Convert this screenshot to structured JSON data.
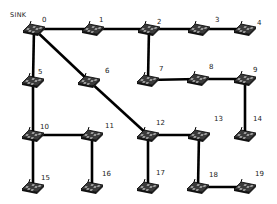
{
  "diagram": {
    "type": "wireless-sensor-network-topology",
    "sink_label": "SINK",
    "sink_node": "0",
    "line_color": "#000000",
    "node_icon": "sensor-mote-icon",
    "nodes": [
      {
        "id": "0",
        "label": "0",
        "x": 34,
        "y": 29,
        "lx": 42,
        "ly": 16
      },
      {
        "id": "1",
        "label": "1",
        "x": 93,
        "y": 29,
        "lx": 99,
        "ly": 16
      },
      {
        "id": "2",
        "label": "2",
        "x": 149,
        "y": 29,
        "lx": 157,
        "ly": 18
      },
      {
        "id": "3",
        "label": "3",
        "x": 199,
        "y": 29,
        "lx": 215,
        "ly": 16
      },
      {
        "id": "4",
        "label": "4",
        "x": 245,
        "y": 29,
        "lx": 257,
        "ly": 19
      },
      {
        "id": "5",
        "label": "5",
        "x": 33,
        "y": 81,
        "lx": 38,
        "ly": 68
      },
      {
        "id": "6",
        "label": "6",
        "x": 89,
        "y": 81,
        "lx": 105,
        "ly": 67
      },
      {
        "id": "7",
        "label": "7",
        "x": 148,
        "y": 80,
        "lx": 159,
        "ly": 65
      },
      {
        "id": "8",
        "label": "8",
        "x": 198,
        "y": 79,
        "lx": 209,
        "ly": 63
      },
      {
        "id": "9",
        "label": "9",
        "x": 245,
        "y": 79,
        "lx": 253,
        "ly": 66
      },
      {
        "id": "10",
        "label": "10",
        "x": 33,
        "y": 135,
        "lx": 40,
        "ly": 123
      },
      {
        "id": "11",
        "label": "11",
        "x": 92,
        "y": 135,
        "lx": 105,
        "ly": 122
      },
      {
        "id": "12",
        "label": "12",
        "x": 148,
        "y": 135,
        "lx": 156,
        "ly": 119
      },
      {
        "id": "13",
        "label": "13",
        "x": 199,
        "y": 135,
        "lx": 214,
        "ly": 115
      },
      {
        "id": "14",
        "label": "14",
        "x": 245,
        "y": 135,
        "lx": 253,
        "ly": 115
      },
      {
        "id": "15",
        "label": "15",
        "x": 33,
        "y": 187,
        "lx": 41,
        "ly": 174
      },
      {
        "id": "16",
        "label": "16",
        "x": 92,
        "y": 187,
        "lx": 102,
        "ly": 170
      },
      {
        "id": "17",
        "label": "17",
        "x": 148,
        "y": 187,
        "lx": 156,
        "ly": 169
      },
      {
        "id": "18",
        "label": "18",
        "x": 198,
        "y": 187,
        "lx": 209,
        "ly": 171
      },
      {
        "id": "19",
        "label": "19",
        "x": 245,
        "y": 187,
        "lx": 255,
        "ly": 170
      }
    ],
    "edges": [
      [
        "0",
        "1"
      ],
      [
        "1",
        "2"
      ],
      [
        "2",
        "3"
      ],
      [
        "3",
        "4"
      ],
      [
        "0",
        "5"
      ],
      [
        "0",
        "6"
      ],
      [
        "6",
        "12"
      ],
      [
        "2",
        "7"
      ],
      [
        "7",
        "8"
      ],
      [
        "8",
        "9"
      ],
      [
        "9",
        "14"
      ],
      [
        "5",
        "10"
      ],
      [
        "10",
        "11"
      ],
      [
        "10",
        "15"
      ],
      [
        "11",
        "16"
      ],
      [
        "12",
        "13"
      ],
      [
        "12",
        "17"
      ],
      [
        "13",
        "18"
      ],
      [
        "18",
        "19"
      ]
    ]
  }
}
